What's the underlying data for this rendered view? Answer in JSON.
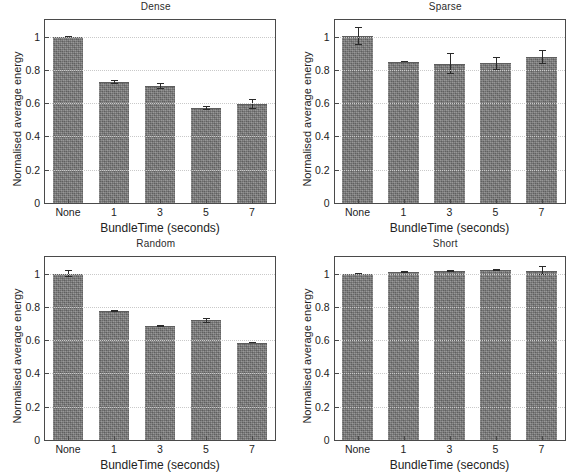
{
  "figure": {
    "ylabel": "Normalised average energy",
    "xlabel": "BundleTime (seconds)",
    "categories": [
      "None",
      "1",
      "3",
      "5",
      "7"
    ],
    "yticks": [
      "0",
      "0.2",
      "0.4",
      "0.6",
      "0.8",
      "1"
    ],
    "bar_color": "#7b7b7b",
    "frame_color": "#4a4a4a",
    "grid_color": "#c9c9c9"
  },
  "panels": [
    {
      "title": "Dense"
    },
    {
      "title": "Sparse"
    },
    {
      "title": "Random"
    },
    {
      "title": "Short"
    }
  ],
  "chart_data": [
    {
      "type": "bar",
      "title": "Dense",
      "xlabel": "BundleTime (seconds)",
      "ylabel": "Normalised average energy",
      "categories": [
        "None",
        "1",
        "3",
        "5",
        "7"
      ],
      "values": [
        1.0,
        0.725,
        0.705,
        0.57,
        0.595
      ],
      "errors": [
        0.005,
        0.012,
        0.018,
        0.012,
        0.028
      ],
      "ylim": [
        0,
        1.1
      ],
      "yticks": [
        0,
        0.2,
        0.4,
        0.6,
        0.8,
        1
      ],
      "grid": true,
      "legend": "none"
    },
    {
      "type": "bar",
      "title": "Sparse",
      "xlabel": "BundleTime (seconds)",
      "ylabel": "Normalised average energy",
      "categories": [
        "None",
        "1",
        "3",
        "5",
        "7"
      ],
      "values": [
        1.005,
        0.85,
        0.838,
        0.84,
        0.875
      ],
      "errors": [
        0.055,
        0.005,
        0.062,
        0.038,
        0.042
      ],
      "ylim": [
        0,
        1.1
      ],
      "yticks": [
        0,
        0.2,
        0.4,
        0.6,
        0.8,
        1
      ],
      "grid": true,
      "legend": "none"
    },
    {
      "type": "bar",
      "title": "Random",
      "xlabel": "BundleTime (seconds)",
      "ylabel": "Normalised average energy",
      "categories": [
        "None",
        "1",
        "3",
        "5",
        "7"
      ],
      "values": [
        1.0,
        0.775,
        0.685,
        0.72,
        0.585
      ],
      "errors": [
        0.022,
        0.004,
        0.004,
        0.016,
        0.004
      ],
      "ylim": [
        0,
        1.1
      ],
      "yticks": [
        0,
        0.2,
        0.4,
        0.6,
        0.8,
        1
      ],
      "grid": true,
      "legend": "none"
    },
    {
      "type": "bar",
      "title": "Short",
      "xlabel": "BundleTime (seconds)",
      "ylabel": "Normalised average energy",
      "categories": [
        "None",
        "1",
        "3",
        "5",
        "7"
      ],
      "values": [
        1.0,
        1.008,
        1.018,
        1.022,
        1.018
      ],
      "errors": [
        0.004,
        0.005,
        0.006,
        0.008,
        0.028
      ],
      "ylim": [
        0,
        1.1
      ],
      "yticks": [
        0,
        0.2,
        0.4,
        0.6,
        0.8,
        1
      ],
      "grid": true,
      "legend": "none"
    }
  ]
}
